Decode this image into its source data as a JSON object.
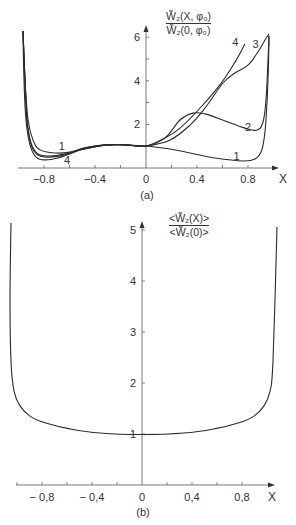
{
  "chart_data": [
    {
      "panel": "a",
      "type": "line",
      "caption": "(a)",
      "xlabel": "X",
      "ylabel": {
        "numerator": "W̃₂(X, φ₀)",
        "denominator": "W̃₂(0, φ₀)"
      },
      "xlim": [
        -1,
        1
      ],
      "ylim": [
        0,
        6.5
      ],
      "xticks": [
        -0.8,
        -0.4,
        0,
        0.4,
        0.8
      ],
      "xtick_labels": [
        "−0.8",
        "−0.4",
        "0",
        "0.4",
        "0.8"
      ],
      "xminor_ticks": [
        -0.8,
        -0.6,
        -0.4,
        -0.2,
        0.2,
        0.4,
        0.6,
        0.8
      ],
      "yticks": [
        2,
        4,
        6
      ],
      "ytick_labels": [
        "2",
        "4",
        "6"
      ],
      "yminor_ticks": [
        1,
        2,
        3,
        4,
        5,
        6
      ],
      "grid": false,
      "legend": "inline curve labels 1–4",
      "series": [
        {
          "name": "1",
          "label_pos": [
            0.71,
            0.55
          ],
          "label_pos_left": [
            -0.66,
            1.0
          ],
          "x": [
            -0.965,
            -0.949,
            -0.925,
            -0.886,
            -0.831,
            -0.714,
            -0.596,
            -0.478,
            -0.322,
            -0.165,
            0,
            0.188,
            0.345,
            0.541,
            0.761,
            0.855,
            0.902,
            0.925,
            0.941,
            0.957,
            0.965
          ],
          "y": [
            6.28,
            4.04,
            2.2,
            1.28,
            0.83,
            0.69,
            0.73,
            0.92,
            1.06,
            1.06,
            1.01,
            0.87,
            0.69,
            0.46,
            0.32,
            0.41,
            0.73,
            1.28,
            2.2,
            4.04,
            6.06
          ]
        },
        {
          "name": "2",
          "label_pos": [
            0.8,
            1.9
          ],
          "x": [
            -0.965,
            -0.949,
            -0.933,
            -0.902,
            -0.847,
            -0.753,
            -0.635,
            -0.518,
            -0.322,
            -0.165,
            0,
            0.149,
            0.267,
            0.369,
            0.463,
            0.62,
            0.776,
            0.871,
            0.918,
            0.941,
            0.957,
            0.965
          ],
          "y": [
            6.28,
            4.04,
            2.2,
            1.15,
            0.64,
            0.55,
            0.64,
            0.83,
            1.05,
            1.06,
            1.01,
            1.38,
            2.2,
            2.52,
            2.48,
            2.16,
            1.83,
            1.74,
            2.11,
            3.12,
            4.95,
            6.06
          ]
        },
        {
          "name": "3",
          "label_pos": [
            0.86,
            5.7
          ],
          "x": [
            -0.965,
            -0.949,
            -0.933,
            -0.904,
            -0.85,
            -0.76,
            -0.64,
            -0.52,
            -0.322,
            -0.165,
            0,
            0.188,
            0.345,
            0.463,
            0.604,
            0.698,
            0.8,
            0.878,
            0.933,
            0.965
          ],
          "y": [
            6.28,
            4.04,
            2.2,
            1.12,
            0.6,
            0.5,
            0.6,
            0.82,
            1.05,
            1.06,
            1.01,
            1.28,
            1.97,
            2.75,
            3.9,
            4.36,
            4.72,
            5.32,
            5.87,
            6.15
          ]
        },
        {
          "name": "4",
          "label_pos": [
            0.7,
            5.8
          ],
          "label_pos_left": [
            -0.62,
            0.35
          ],
          "x": [
            -0.965,
            -0.957,
            -0.941,
            -0.91,
            -0.863,
            -0.792,
            -0.69,
            -0.58,
            -0.478,
            -0.322,
            -0.165,
            0,
            0.149,
            0.267,
            0.424,
            0.58,
            0.698,
            0.776
          ],
          "y": [
            6.28,
            4.04,
            2.2,
            1.06,
            0.5,
            0.37,
            0.46,
            0.69,
            0.92,
            1.05,
            1.06,
            1.01,
            1.38,
            1.83,
            2.75,
            3.81,
            4.86,
            5.69
          ]
        }
      ]
    },
    {
      "panel": "b",
      "type": "line",
      "caption": "(b)",
      "xlabel": "X",
      "ylabel": {
        "numerator": "<W̃₂(X)>",
        "denominator": "<W̃₂(0)>"
      },
      "xlim": [
        -1,
        1
      ],
      "ylim": [
        0,
        5.2
      ],
      "xticks": [
        -0.8,
        -0.4,
        0,
        0.4,
        0.8
      ],
      "xtick_labels": [
        "− 0,8",
        "− 0,4",
        "0",
        "0,4",
        "0,8"
      ],
      "xminor_ticks": [
        -1.0,
        -0.8,
        -0.6,
        -0.4,
        -0.2,
        0.2,
        0.4,
        0.6,
        0.8
      ],
      "yticks": [
        1,
        2,
        3,
        4,
        5
      ],
      "ytick_labels": [
        "1",
        "2",
        "3",
        "4",
        "5"
      ],
      "grid": false,
      "series": [
        {
          "name": "mean",
          "x": [
            -1.048,
            -1.056,
            -1.048,
            -1.024,
            -0.976,
            -0.896,
            -0.776,
            -0.576,
            -0.336,
            0,
            0.336,
            0.576,
            0.776,
            0.896,
            0.976,
            1.024,
            1.048,
            1.08
          ],
          "y": [
            5.14,
            3.61,
            2.43,
            1.84,
            1.55,
            1.35,
            1.22,
            1.1,
            1.02,
            0.99,
            1.02,
            1.1,
            1.22,
            1.35,
            1.55,
            1.84,
            2.43,
            5.06
          ]
        }
      ]
    }
  ],
  "panel_a": {
    "caption": "(a)",
    "x_axis_name": "X",
    "y_numerator": "W̃₂(X, φ₀)",
    "y_denominator": "W̃₂(0, φ₀)"
  },
  "panel_b": {
    "caption": "(b)",
    "x_axis_name": "X",
    "y_numerator": "<W̃₂(X)>",
    "y_denominator": "<W̃₂(0)>"
  },
  "style": {
    "line_color": "#2a2a2a",
    "axis_color": "#555555"
  }
}
